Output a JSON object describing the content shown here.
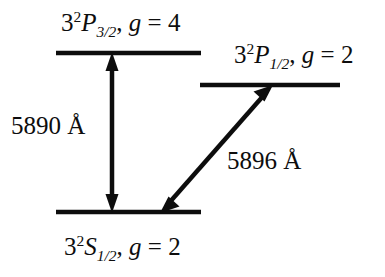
{
  "diagram": {
    "background_color": "#ffffff",
    "line_color": "#0d0d0d",
    "levels": [
      {
        "id": "p32",
        "name": "32P3/2",
        "prefix": "3",
        "multiplicity": "2",
        "term": "P",
        "j": "3/2",
        "comma": ", ",
        "g_symbol": "g",
        "g_relation": " = ",
        "g_value": "4",
        "label_full": "3²P3/2, g = 4",
        "x1": 56,
        "x2": 201,
        "y": 53
      },
      {
        "id": "p12",
        "name": "32P1/2",
        "prefix": "3",
        "multiplicity": "2",
        "term": "P",
        "j": "1/2",
        "comma": ", ",
        "g_symbol": "g",
        "g_relation": " = ",
        "g_value": "2",
        "label_full": "3²P1/2, g = 2",
        "x1": 200,
        "x2": 340,
        "y": 85
      },
      {
        "id": "s12",
        "name": "32S1/2",
        "prefix": "3",
        "multiplicity": "2",
        "term": "S",
        "j": "1/2",
        "comma": ", ",
        "g_symbol": "g",
        "g_relation": " = ",
        "g_value": "2",
        "label_full": "3²S1/2, g = 2",
        "x1": 56,
        "x2": 201,
        "y": 212
      }
    ],
    "transitions": [
      {
        "id": "d2",
        "wavelength": "5890 Å",
        "from": "s12",
        "to": "p32",
        "x1": 112,
        "y1": 212,
        "x2": 112,
        "y2": 53,
        "double_headed": true
      },
      {
        "id": "d1",
        "wavelength": "5896 Å",
        "from": "s12",
        "to": "p12",
        "x1": 161,
        "y1": 212,
        "x2": 272,
        "y2": 86,
        "double_headed": true
      }
    ]
  }
}
